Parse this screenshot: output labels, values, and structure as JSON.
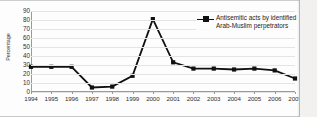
{
  "chart_data": {
    "type": "line",
    "title": "",
    "xlabel": "",
    "ylabel": "Percentage",
    "ylim": [
      0,
      90
    ],
    "ytick_step": 10,
    "grid": true,
    "legend_position": "upper-right",
    "categories": [
      "1994",
      "1995",
      "1996",
      "1997",
      "1998",
      "1999",
      "2000",
      "2001",
      "2002",
      "2003",
      "2004",
      "2005",
      "2006",
      "2007"
    ],
    "yticks": [
      "0",
      "10",
      "20",
      "30",
      "40",
      "50",
      "60",
      "70",
      "80",
      "90"
    ],
    "series": [
      {
        "name": "Antisemitic acts by identified Arab-Muslim perpetrators",
        "marker": "square",
        "color": "#111111",
        "values": [
          28,
          28,
          28,
          5,
          6,
          18,
          81,
          33,
          26,
          26,
          25,
          26,
          24,
          15
        ]
      }
    ]
  },
  "legend": {
    "entries": [
      {
        "label": "Antisemitic acts by identified Arab-Muslim perpetrators",
        "marker_icon": "line-square-marker-icon"
      }
    ]
  },
  "axes": {
    "y_title": "Percentage"
  }
}
